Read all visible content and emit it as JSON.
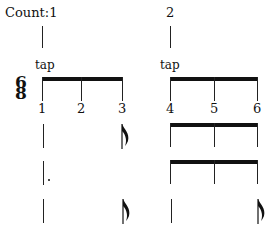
{
  "count_label": "Count:",
  "counts": [
    "1",
    "2"
  ],
  "tap_labels": [
    "tap",
    "tap"
  ],
  "time_signature": {
    "top": "6",
    "bottom": "8"
  },
  "beats": [
    "1",
    "2",
    "3",
    "4",
    "5",
    "6"
  ],
  "rows": [
    {
      "group1": "quarter + eighth",
      "group2": "three beamed eighths"
    },
    {
      "group1": "dotted quarter",
      "group2": "three beamed eighths"
    },
    {
      "group1": "quarter + eighth",
      "group2": "quarter + eighth"
    }
  ]
}
